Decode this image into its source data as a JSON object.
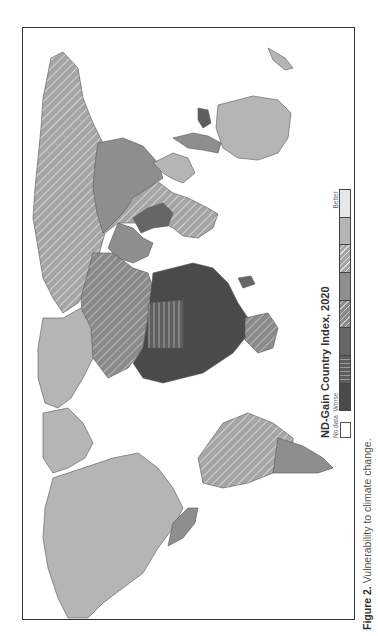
{
  "figure": {
    "caption_label": "Figure 2.",
    "caption_text": " Vulnerability to climate change."
  },
  "legend": {
    "title": "ND-Gain Country Index, 2020",
    "no_data_label": "No data",
    "worse_label": "Worse",
    "better_label": "Better",
    "swatches": [
      {
        "id": "c1",
        "color": "#4a4a4a",
        "pattern": "solid",
        "meaning": "worst"
      },
      {
        "id": "c2",
        "color": "#5e5e5e",
        "pattern": "vertical-stripes"
      },
      {
        "id": "c3",
        "color": "#666666",
        "pattern": "solid"
      },
      {
        "id": "c4",
        "color": "#8a8a8a",
        "pattern": "diagonal-hatch"
      },
      {
        "id": "c5",
        "color": "#8e8e8e",
        "pattern": "solid"
      },
      {
        "id": "c6",
        "color": "#a5a5a5",
        "pattern": "diagonal-hatch"
      },
      {
        "id": "c7",
        "color": "#b5b5b5",
        "pattern": "solid"
      },
      {
        "id": "c8",
        "color": "#e8e8e8",
        "pattern": "solid",
        "meaning": "best"
      }
    ],
    "no_data_color": "#ffffff"
  },
  "map": {
    "orientation": "rotated 90 degrees counter-clockwise",
    "regions": [
      {
        "name": "North America",
        "class": "c7"
      },
      {
        "name": "Greenland",
        "class": "c7"
      },
      {
        "name": "Central America / Mexico",
        "class": "c5"
      },
      {
        "name": "South America north",
        "class": "c6"
      },
      {
        "name": "South America south",
        "class": "c5"
      },
      {
        "name": "Europe",
        "class": "c7"
      },
      {
        "name": "Russia",
        "class": "c6"
      },
      {
        "name": "North Africa",
        "class": "c6"
      },
      {
        "name": "Sub-Saharan Africa",
        "class": "c1"
      },
      {
        "name": "Sahel",
        "class": "c2"
      },
      {
        "name": "Middle East",
        "class": "c5"
      },
      {
        "name": "South Asia",
        "class": "c3"
      },
      {
        "name": "China",
        "class": "c5"
      },
      {
        "name": "Southeast Asia",
        "class": "c5"
      },
      {
        "name": "Australia",
        "class": "c7"
      },
      {
        "name": "Madagascar",
        "class": "c3"
      }
    ]
  }
}
